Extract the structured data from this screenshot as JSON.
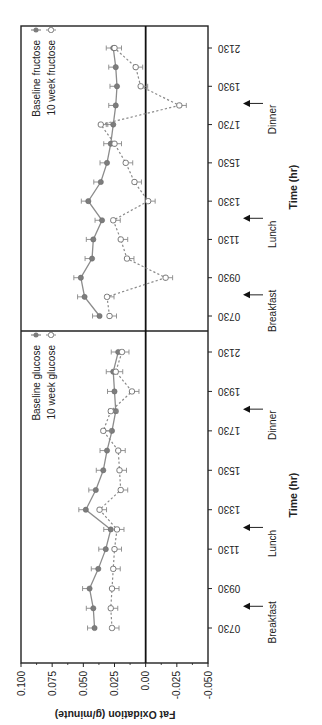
{
  "chart_data": {
    "type": "line",
    "orientation": "rotated-90-ccw",
    "ylabel": "Fat Oxidation (g/minute)",
    "xlabel": "Time (hr)",
    "ylim": [
      -0.05,
      0.1
    ],
    "yticks": [
      "0.100",
      "0.075",
      "0.050",
      "0.025",
      "0.00",
      "-0.025",
      "-0.050"
    ],
    "xticks": [
      "0730",
      "0930",
      "1130",
      "1330",
      "1530",
      "1730",
      "1930",
      "2130"
    ],
    "x": [
      "0730",
      "0830",
      "0930",
      "1030",
      "1130",
      "1230",
      "1330",
      "1430",
      "1530",
      "1630",
      "1730",
      "1830",
      "1930",
      "2030",
      "2130"
    ],
    "panels": [
      {
        "name": "glucose",
        "legend": [
          "Baseline glucose",
          "10 week glucose"
        ],
        "meals": [
          {
            "label": "Breakfast",
            "time": "0830"
          },
          {
            "label": "Lunch",
            "time": "1230"
          },
          {
            "label": "Dinner",
            "time": "1830"
          }
        ],
        "series": [
          {
            "name": "Baseline glucose",
            "style": "solid-filled",
            "values": [
              0.041,
              0.042,
              0.045,
              0.038,
              0.032,
              0.028,
              0.048,
              0.04,
              0.034,
              0.031,
              0.027,
              0.024,
              0.025,
              0.026,
              0.022
            ]
          },
          {
            "name": "10 week glucose",
            "style": "dashed-open",
            "values": [
              0.027,
              0.028,
              0.027,
              0.026,
              0.025,
              0.023,
              0.037,
              0.02,
              0.021,
              0.022,
              0.034,
              0.028,
              0.011,
              0.024,
              0.019
            ]
          }
        ]
      },
      {
        "name": "fructose",
        "legend": [
          "Baseline fructose",
          "10 week fructose"
        ],
        "meals": [
          {
            "label": "Breakfast",
            "time": "0830"
          },
          {
            "label": "Lunch",
            "time": "1230"
          },
          {
            "label": "Dinner",
            "time": "1830"
          }
        ],
        "series": [
          {
            "name": "Baseline fructose",
            "style": "solid-filled",
            "values": [
              0.037,
              0.049,
              0.052,
              0.043,
              0.042,
              0.035,
              0.046,
              0.036,
              0.031,
              0.028,
              0.026,
              0.024,
              0.023,
              0.024,
              0.026
            ]
          },
          {
            "name": "10 week fructose",
            "style": "dashed-open",
            "values": [
              0.029,
              0.031,
              -0.016,
              0.015,
              0.02,
              0.026,
              -0.002,
              0.009,
              0.016,
              0.025,
              0.036,
              -0.027,
              0.004,
              0.008,
              0.025
            ]
          }
        ]
      }
    ],
    "grid": false,
    "legend_position": "upper-left (in each panel)"
  }
}
